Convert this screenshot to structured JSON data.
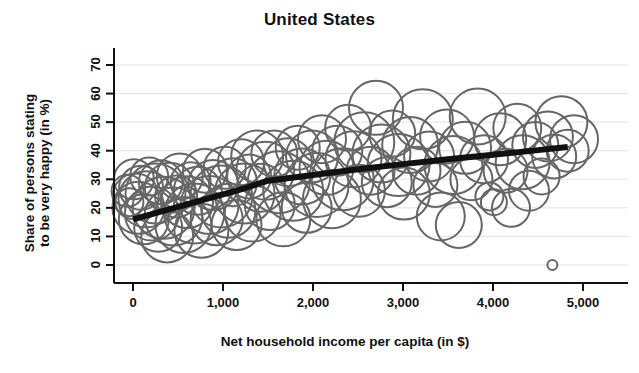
{
  "chart_data": {
    "type": "scatter",
    "title": "United States",
    "xlabel": "Net household income per capita (in $)",
    "ylabel": "Share of persons stating to be very happy (in %)",
    "ylabel_line1": "Share of persons stating",
    "ylabel_line2": "to be very happy (in %)",
    "xlim": [
      -300,
      5150
    ],
    "ylim": [
      -6,
      74
    ],
    "xticks": [
      0,
      1000,
      2000,
      3000,
      4000,
      5000
    ],
    "xtick_labels": [
      "0",
      "1,000",
      "2,000",
      "3,000",
      "4,000",
      "5,000"
    ],
    "yticks": [
      0,
      10,
      20,
      30,
      40,
      50,
      60,
      70
    ],
    "ytick_labels": [
      "0",
      "10",
      "20",
      "30",
      "40",
      "50",
      "60",
      "70"
    ],
    "grid": true,
    "grid_color": "#e3e3e3",
    "legend": "none",
    "marker_style": "open-circle",
    "marker_color": "#666666",
    "marker_stroke_width": 2,
    "trend_color": "#111111",
    "trend_width": 6,
    "trend_line": [
      {
        "x": 0,
        "y": 16.0
      },
      {
        "x": 400,
        "y": 19.5
      },
      {
        "x": 800,
        "y": 23.0
      },
      {
        "x": 1200,
        "y": 26.5
      },
      {
        "x": 1500,
        "y": 29.5
      },
      {
        "x": 2000,
        "y": 31.5
      },
      {
        "x": 2500,
        "y": 33.5
      },
      {
        "x": 3000,
        "y": 35.3
      },
      {
        "x": 3500,
        "y": 37.0
      },
      {
        "x": 4000,
        "y": 38.6
      },
      {
        "x": 4500,
        "y": 40.2
      },
      {
        "x": 4830,
        "y": 41.3
      }
    ],
    "bubbles": [
      {
        "x": -60,
        "y": 26,
        "r": 16
      },
      {
        "x": -40,
        "y": 22,
        "r": 14
      },
      {
        "x": 10,
        "y": 30,
        "r": 20
      },
      {
        "x": 30,
        "y": 24,
        "r": 23
      },
      {
        "x": 60,
        "y": 20,
        "r": 26
      },
      {
        "x": 90,
        "y": 27,
        "r": 22
      },
      {
        "x": 120,
        "y": 16,
        "r": 25
      },
      {
        "x": 150,
        "y": 23,
        "r": 28
      },
      {
        "x": 180,
        "y": 31,
        "r": 19
      },
      {
        "x": 210,
        "y": 18,
        "r": 27
      },
      {
        "x": 250,
        "y": 25,
        "r": 30
      },
      {
        "x": 280,
        "y": 13,
        "r": 24
      },
      {
        "x": 310,
        "y": 29,
        "r": 22
      },
      {
        "x": 340,
        "y": 20,
        "r": 31
      },
      {
        "x": 380,
        "y": 10,
        "r": 26
      },
      {
        "x": 410,
        "y": 27,
        "r": 25
      },
      {
        "x": 450,
        "y": 17,
        "r": 29
      },
      {
        "x": 480,
        "y": 24,
        "r": 21
      },
      {
        "x": 520,
        "y": 31,
        "r": 23
      },
      {
        "x": 560,
        "y": 14,
        "r": 28
      },
      {
        "x": 600,
        "y": 22,
        "r": 26
      },
      {
        "x": 640,
        "y": 29,
        "r": 20
      },
      {
        "x": 680,
        "y": 18,
        "r": 30
      },
      {
        "x": 720,
        "y": 26,
        "r": 24
      },
      {
        "x": 760,
        "y": 12,
        "r": 27
      },
      {
        "x": 800,
        "y": 33,
        "r": 22
      },
      {
        "x": 850,
        "y": 21,
        "r": 29
      },
      {
        "x": 890,
        "y": 28,
        "r": 25
      },
      {
        "x": 930,
        "y": 16,
        "r": 26
      },
      {
        "x": 980,
        "y": 24,
        "r": 31
      },
      {
        "x": 1020,
        "y": 34,
        "r": 21
      },
      {
        "x": 1060,
        "y": 19,
        "r": 27
      },
      {
        "x": 1110,
        "y": 29,
        "r": 24
      },
      {
        "x": 1150,
        "y": 14,
        "r": 25
      },
      {
        "x": 1200,
        "y": 36,
        "r": 23
      },
      {
        "x": 1240,
        "y": 25,
        "r": 30
      },
      {
        "x": 1290,
        "y": 31,
        "r": 22
      },
      {
        "x": 1330,
        "y": 18,
        "r": 28
      },
      {
        "x": 1380,
        "y": 38,
        "r": 26
      },
      {
        "x": 1420,
        "y": 27,
        "r": 24
      },
      {
        "x": 1470,
        "y": 33,
        "r": 29
      },
      {
        "x": 1520,
        "y": 21,
        "r": 25
      },
      {
        "x": 1570,
        "y": 39,
        "r": 23
      },
      {
        "x": 1620,
        "y": 29,
        "r": 31
      },
      {
        "x": 1670,
        "y": 16,
        "r": 27
      },
      {
        "x": 1720,
        "y": 36,
        "r": 24
      },
      {
        "x": 1780,
        "y": 26,
        "r": 30
      },
      {
        "x": 1830,
        "y": 41,
        "r": 22
      },
      {
        "x": 1880,
        "y": 31,
        "r": 28
      },
      {
        "x": 1930,
        "y": 20,
        "r": 25
      },
      {
        "x": 1990,
        "y": 38,
        "r": 26
      },
      {
        "x": 2040,
        "y": 28,
        "r": 32
      },
      {
        "x": 2100,
        "y": 44,
        "r": 24
      },
      {
        "x": 2150,
        "y": 34,
        "r": 27
      },
      {
        "x": 2210,
        "y": 23,
        "r": 29
      },
      {
        "x": 2270,
        "y": 40,
        "r": 25
      },
      {
        "x": 2330,
        "y": 30,
        "r": 31
      },
      {
        "x": 2390,
        "y": 48,
        "r": 23
      },
      {
        "x": 2450,
        "y": 37,
        "r": 28
      },
      {
        "x": 2510,
        "y": 26,
        "r": 26
      },
      {
        "x": 2570,
        "y": 43,
        "r": 30
      },
      {
        "x": 2640,
        "y": 33,
        "r": 24
      },
      {
        "x": 2700,
        "y": 55,
        "r": 27
      },
      {
        "x": 2760,
        "y": 39,
        "r": 29
      },
      {
        "x": 2820,
        "y": 29,
        "r": 25
      },
      {
        "x": 2880,
        "y": 46,
        "r": 23
      },
      {
        "x": 2950,
        "y": 35,
        "r": 31
      },
      {
        "x": 3010,
        "y": 25,
        "r": 26
      },
      {
        "x": 3080,
        "y": 42,
        "r": 28
      },
      {
        "x": 3150,
        "y": 33,
        "r": 24
      },
      {
        "x": 3220,
        "y": 51,
        "r": 30
      },
      {
        "x": 3290,
        "y": 38,
        "r": 25
      },
      {
        "x": 3360,
        "y": 28,
        "r": 22
      },
      {
        "x": 3420,
        "y": 17,
        "r": 24
      },
      {
        "x": 3490,
        "y": 45,
        "r": 27
      },
      {
        "x": 3560,
        "y": 35,
        "r": 29
      },
      {
        "x": 3620,
        "y": 14,
        "r": 23
      },
      {
        "x": 3690,
        "y": 41,
        "r": 26
      },
      {
        "x": 3760,
        "y": 30,
        "r": 21
      },
      {
        "x": 3830,
        "y": 52,
        "r": 28
      },
      {
        "x": 3900,
        "y": 37,
        "r": 24
      },
      {
        "x": 3960,
        "y": 24,
        "r": 14
      },
      {
        "x": 4010,
        "y": 22,
        "r": 13
      },
      {
        "x": 4080,
        "y": 44,
        "r": 26
      },
      {
        "x": 4140,
        "y": 33,
        "r": 22
      },
      {
        "x": 4200,
        "y": 20,
        "r": 19
      },
      {
        "x": 4270,
        "y": 48,
        "r": 24
      },
      {
        "x": 4330,
        "y": 36,
        "r": 27
      },
      {
        "x": 4400,
        "y": 26,
        "r": 20
      },
      {
        "x": 4470,
        "y": 42,
        "r": 23
      },
      {
        "x": 4540,
        "y": 31,
        "r": 18
      },
      {
        "x": 4610,
        "y": 45,
        "r": 25
      },
      {
        "x": 4680,
        "y": 38,
        "r": 22
      },
      {
        "x": 4660,
        "y": 0,
        "r": 5
      },
      {
        "x": 4760,
        "y": 50,
        "r": 26
      },
      {
        "x": 4830,
        "y": 40,
        "r": 21
      },
      {
        "x": 4900,
        "y": 44,
        "r": 24
      }
    ]
  }
}
